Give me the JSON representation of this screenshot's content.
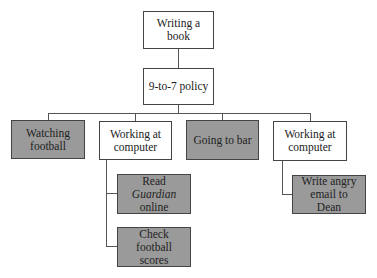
{
  "diagram": {
    "root": {
      "label": "Writing a book"
    },
    "policy": {
      "label": "9-to-7 policy"
    },
    "level2": [
      {
        "line1": "Watching",
        "line2": "football",
        "shaded": true
      },
      {
        "line1": "Working at",
        "line2": "computer",
        "shaded": false
      },
      {
        "line1": "Going to bar",
        "line2": "",
        "shaded": true
      },
      {
        "line1": "Working at",
        "line2": "computer",
        "shaded": false
      }
    ],
    "sub_left": [
      {
        "prefix": "Read ",
        "italic": "Guardian",
        "line2": "online",
        "shaded": true
      },
      {
        "line1": "Check football",
        "line2": "scores",
        "shaded": true
      }
    ],
    "sub_right": [
      {
        "line1": "Write angry",
        "line2": "email to Dean",
        "shaded": true
      }
    ],
    "colors": {
      "shaded_fill": "#9a9a9a",
      "plain_fill": "#ffffff",
      "stroke": "#444444"
    }
  }
}
